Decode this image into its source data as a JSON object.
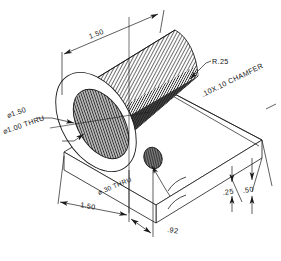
{
  "drawing": {
    "title": "Isometric Part Drawing",
    "background_color": "#ffffff",
    "line_color": "#1a1a1a",
    "dimensions": [
      {
        "id": "length_top",
        "label": "1.50",
        "name": "dimension-1-50-top"
      },
      {
        "id": "bore_outer",
        "label": "⌀1.50",
        "name": "dimension-dia-1-50"
      },
      {
        "id": "bore_thru",
        "label": "⌀1.00  THRU",
        "name": "dimension-dia-1-00-thru"
      },
      {
        "id": "fillet",
        "label": "R.25",
        "name": "dimension-r-25"
      },
      {
        "id": "chamfer",
        "label": ".10X.10  CHAMFER",
        "name": "note-chamfer"
      },
      {
        "id": "hole_small",
        "label": "⌀.30 THRU",
        "name": "dimension-dia-30-thru"
      },
      {
        "id": "base_width",
        "label": "1.50",
        "name": "dimension-1-50-base"
      },
      {
        "id": "hole_offset",
        "label": ".92",
        "name": "dimension-92"
      },
      {
        "id": "plate_thick",
        "label": ".25",
        "name": "dimension-25"
      },
      {
        "id": "overall_height",
        "label": ".50",
        "name": "dimension-50"
      }
    ]
  }
}
